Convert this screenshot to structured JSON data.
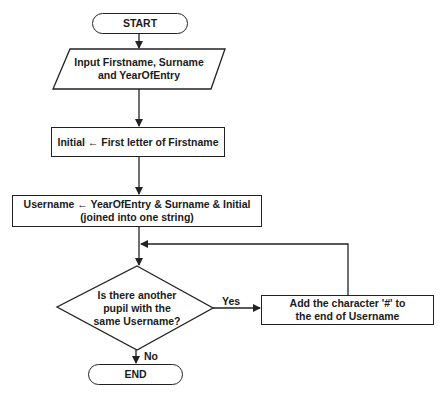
{
  "flowchart": {
    "start": "START",
    "input": {
      "line1": "Input Firstname, Surname",
      "line2": "and YearOfEntry"
    },
    "initial": "Initial ← First letter of Firstname",
    "username": {
      "line1": "Username ← YearOfEntry & Surname & Initial",
      "line2": "(joined into one string)"
    },
    "decision": {
      "line1": "Is there another",
      "line2": "pupil with the",
      "line3": "same Username?"
    },
    "yes_label": "Yes",
    "no_label": "No",
    "add_hash": {
      "line1": "Add the character '#' to",
      "line2": "the end of Username"
    },
    "end": "END"
  },
  "colors": {
    "stroke": "#222222",
    "text": "#1a1a1a",
    "background": "#ffffff"
  }
}
